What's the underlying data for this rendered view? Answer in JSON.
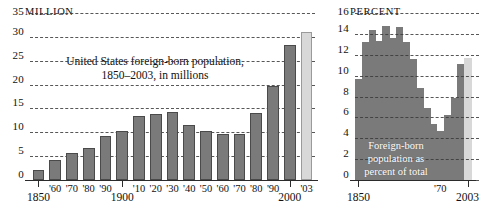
{
  "figure": {
    "background": "#ffffff",
    "bar_color": "#7a7a7a",
    "highlight_color": "#d8d8d8",
    "grid_color": "#3a3a3a"
  },
  "chart_data": [
    {
      "id": "millions",
      "type": "bar",
      "title": "United States foreign-born population,",
      "subtitle": "1850–2003, in millions",
      "unit_label": "MILLION",
      "ylabel": "",
      "xlabel": "",
      "ylim": [
        0,
        35
      ],
      "grid": true,
      "yticks": [
        0,
        5,
        10,
        15,
        20,
        25,
        30,
        35
      ],
      "ytick_labels": [
        "0",
        "5",
        "10",
        "15",
        "20",
        "25",
        "30",
        "35"
      ],
      "categories": [
        "1850",
        "'60",
        "'70",
        "'80",
        "'90",
        "1900",
        "'10",
        "'20",
        "'30",
        "'40",
        "'50",
        "'60",
        "'70",
        "'80",
        "'90",
        "2000",
        "'03"
      ],
      "values": [
        2.2,
        4.1,
        5.6,
        6.7,
        9.2,
        10.3,
        13.5,
        13.9,
        14.2,
        11.6,
        10.3,
        9.7,
        9.6,
        14.1,
        19.8,
        28.4,
        31.1
      ],
      "highlight_index": 16,
      "major_ticks": [
        "1850",
        "1900",
        "2000"
      ]
    },
    {
      "id": "percent",
      "type": "area",
      "title": "Foreign-born",
      "subtitle": "population as",
      "subtitle2": "percent of total",
      "unit_label": "PERCENT",
      "ylim": [
        0,
        16
      ],
      "grid": true,
      "yticks": [
        0,
        2,
        4,
        6,
        8,
        10,
        12,
        14,
        16
      ],
      "ytick_labels": [
        "0",
        "2",
        "4",
        "6",
        "8",
        "10",
        "12",
        "14",
        "16"
      ],
      "categories": [
        "1850",
        "1860",
        "1870",
        "1880",
        "1890",
        "1900",
        "1910",
        "1920",
        "1930",
        "1940",
        "1950",
        "1960",
        "1970",
        "1980",
        "1990",
        "2000",
        "2003"
      ],
      "values": [
        9.7,
        13.2,
        14.4,
        13.3,
        14.8,
        13.6,
        14.7,
        13.2,
        11.6,
        8.8,
        6.9,
        5.4,
        4.7,
        6.2,
        7.9,
        11.1,
        11.7
      ],
      "highlight_index": 16,
      "axis_labels": [
        "1850",
        "'70",
        "2003"
      ]
    }
  ],
  "left_panel": {
    "unit": "MILLION",
    "unit_value": "35",
    "title_line1": "United States foreign-born population,",
    "title_line2": "1850–2003, in millions",
    "yticks": [
      "30",
      "25",
      "20",
      "15",
      "10",
      "5",
      "0"
    ],
    "xlabels": [
      "'60",
      "'70",
      "'80",
      "'90",
      "'10",
      "'20",
      "'30",
      "'40",
      "'50",
      "'60",
      "'70",
      "'80",
      "'90",
      "'03"
    ],
    "major_labels": [
      "1850",
      "1900",
      "2000"
    ]
  },
  "right_panel": {
    "unit": "PERCENT",
    "unit_value": "16",
    "yticks": [
      "14",
      "12",
      "10",
      "8",
      "6",
      "4",
      "2",
      "0"
    ],
    "caption_line1": "Foreign-born",
    "caption_line2": "population as",
    "caption_line3": "percent of total",
    "xlabels": [
      "1850",
      "'70",
      "2003"
    ]
  }
}
